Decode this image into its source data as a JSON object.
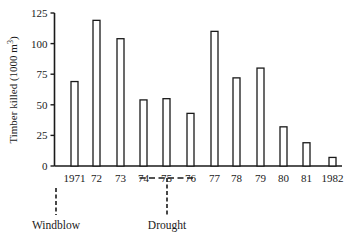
{
  "chart_data": {
    "type": "bar",
    "title": "",
    "xlabel": "",
    "ylabel": "Timber killed (1000 m³)",
    "ylabel_parts": {
      "text": "Timber killed (1000 m",
      "sup": "3",
      "close": ")"
    },
    "ylim": [
      0,
      125
    ],
    "yticks": [
      0,
      25,
      50,
      75,
      100,
      125
    ],
    "grid": false,
    "legend": null,
    "bar_style": {
      "fill": "#ffffff",
      "stroke": "#1a1a1a"
    },
    "categories": [
      "1971",
      "72",
      "73",
      "74",
      "75",
      "76",
      "77",
      "78",
      "79",
      "80",
      "81",
      "1982"
    ],
    "years": [
      1971,
      1972,
      1973,
      1974,
      1975,
      1976,
      1977,
      1978,
      1979,
      1980,
      1981,
      1982
    ],
    "values": [
      69,
      119,
      104,
      54,
      55,
      43,
      110,
      72,
      80,
      32,
      19,
      7
    ],
    "annotations": [
      {
        "label": "Windblow",
        "year": 1971,
        "type": "event-marker"
      },
      {
        "label": "Drought",
        "years": [
          1974,
          1976
        ],
        "type": "period-marker"
      }
    ]
  }
}
